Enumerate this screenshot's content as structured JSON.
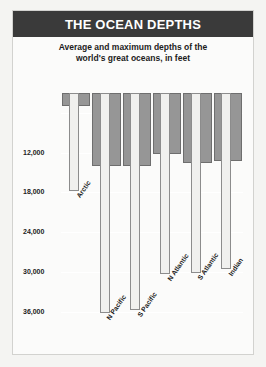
{
  "header": {
    "title": "THE OCEAN DEPTHS"
  },
  "subtitle": {
    "line1": "Average and maximum depths of the",
    "line2": "world's great oceans, in feet"
  },
  "colors": {
    "header_bg": "#3a3a3a",
    "header_text": "#ffffff",
    "card_bg": "#fbfbfa",
    "page_bg": "#f4f4f2",
    "average_bar": "#969696",
    "average_bar_border": "#6e6e6e",
    "maximum_bar": "#f0f0ee",
    "maximum_bar_border": "#8c8c8c",
    "gridline": "#ffffff",
    "text": "#1c1c1c"
  },
  "chart_data": {
    "type": "bar",
    "title": "THE OCEAN DEPTHS",
    "subtitle": "Average and maximum depths of the world's great oceans, in feet",
    "xlabel": "",
    "ylabel": "",
    "unit": "feet",
    "grid": true,
    "legend_position": "none",
    "y_axis_inverted": true,
    "ylim": [
      0,
      38000
    ],
    "yticks": [
      6000,
      12000,
      18000,
      24000,
      30000,
      36000
    ],
    "ytick_labels": [
      "",
      "12,000",
      "18,000",
      "24,000",
      "30,000",
      "36,000"
    ],
    "categories": [
      "Arctic",
      "N Pacific",
      "S Pacific",
      "N Atlantic",
      "S Atlantic",
      "Indian"
    ],
    "series": [
      {
        "name": "Average depth",
        "values": [
          5000,
          14000,
          14000,
          12200,
          13600,
          13200
        ],
        "bar_style": "wide-gray"
      },
      {
        "name": "Maximum depth",
        "values": [
          17850,
          36200,
          35700,
          30250,
          30200,
          29500
        ],
        "bar_style": "narrow-light"
      }
    ],
    "series_start_depth": 3000
  }
}
